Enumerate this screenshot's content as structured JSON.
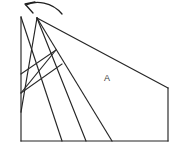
{
  "figure": {
    "background_color": "#ffffff",
    "line_color": "#252525",
    "arrow_color": "#1f1f1f",
    "canvas": {
      "width": 185,
      "height": 153
    },
    "labels": [
      {
        "id": "region-a",
        "text": "A",
        "x": 107,
        "y": 81
      }
    ],
    "arrow": {
      "name": "fold-direction-arrow",
      "description": "curved arrow pointing up-left",
      "arc_path": "M 62 14 C 52 2 36 0 26 5",
      "head_path": "M 33 13 L 25 4 L 35 2"
    },
    "outline": {
      "name": "outer-boundary",
      "points": "21,17 21,141 168,141 168,88 21,17"
    },
    "edges": [
      {
        "name": "left-vertical-edge",
        "path": "M 21 17 L 21 141"
      },
      {
        "name": "bottom-horizontal-edge",
        "path": "M 21 141 L 168 141"
      },
      {
        "name": "right-vertical-edge",
        "path": "M 168 88 L 168 141"
      },
      {
        "name": "top-right-slanted-edge",
        "path": "M 37 18 L 168 88"
      }
    ],
    "fold_lines": [
      {
        "name": "fold-line-1",
        "path": "M 21 17 L 62 141"
      },
      {
        "name": "fold-line-2",
        "path": "M 37 18 L 86 141"
      },
      {
        "name": "fold-line-3",
        "path": "M 37 18 L 112 141"
      },
      {
        "name": "crease-long-left",
        "path": "M 37 18 L 21 112"
      },
      {
        "name": "crease-fan-1",
        "path": "M 56 50 L 21 74"
      },
      {
        "name": "crease-fan-2",
        "path": "M 56 50 L 21 93"
      },
      {
        "name": "crease-fan-3",
        "path": "M 62 64 L 21 93"
      }
    ]
  }
}
